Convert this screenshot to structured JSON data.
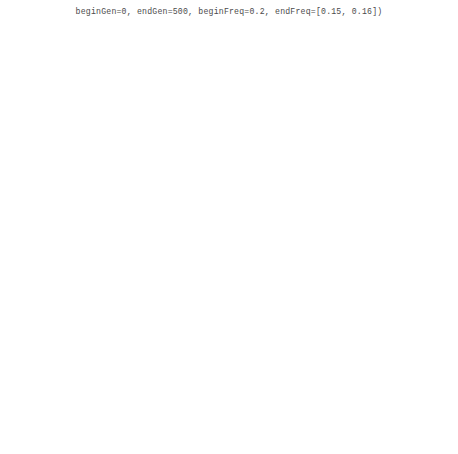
{
  "header": {
    "code_line": "beginGen=0, endGen=500, beginFreq=0.2, endFreq=[0.15, 0.16])"
  },
  "figure": {
    "xlabel": "Generation",
    "ylabel": "Allele frequency",
    "xticks": [
      0,
      100,
      200,
      300,
      400,
      500
    ],
    "panel_labels": [
      "(a)",
      "(b)",
      "(c)",
      "(d)"
    ]
  },
  "chart_data": [
    {
      "type": "line",
      "panel": "(a)",
      "title": "Constant population size",
      "xlabel": "Generation",
      "ylabel": "Allele frequency",
      "xlim": [
        0,
        500
      ],
      "ylim": [
        0.0,
        0.62
      ],
      "yticks": [
        0.0,
        0.1,
        0.2,
        0.3,
        0.4,
        0.5,
        0.6
      ],
      "ytick_labels": [
        "0.0",
        "0.1",
        "0.2",
        "0.3",
        "0.4",
        "0.5",
        "0.6"
      ],
      "grid": false,
      "legend": "none",
      "x": [
        0,
        10,
        20,
        30,
        40,
        50,
        60,
        70,
        80,
        90,
        100,
        110,
        120,
        130,
        140,
        150,
        160,
        170,
        180,
        190,
        200,
        210,
        220,
        230,
        240,
        250,
        260,
        270,
        280,
        290,
        300,
        310,
        320,
        330,
        340,
        350,
        360,
        370,
        380,
        390,
        400,
        410,
        420,
        430,
        440,
        450,
        460,
        470,
        480,
        490,
        500
      ],
      "series": [
        {
          "name": "upper bound",
          "style": "dashed",
          "values": [
            0.2,
            0.225,
            0.243,
            0.252,
            0.258,
            0.266,
            0.272,
            0.28,
            0.286,
            0.281,
            0.276,
            0.272,
            0.27,
            0.268,
            0.266,
            0.264,
            0.262,
            0.266,
            0.272,
            0.276,
            0.281,
            0.286,
            0.29,
            0.294,
            0.296,
            0.293,
            0.29,
            0.288,
            0.292,
            0.296,
            0.293,
            0.288,
            0.284,
            0.281,
            0.278,
            0.276,
            0.273,
            0.27,
            0.268,
            0.266,
            0.264,
            0.261,
            0.258,
            0.254,
            0.25,
            0.243,
            0.232,
            0.218,
            0.2,
            0.18,
            0.158
          ]
        },
        {
          "name": "median",
          "style": "solid",
          "values": [
            0.2,
            0.203,
            0.196,
            0.192,
            0.188,
            0.186,
            0.19,
            0.193,
            0.19,
            0.187,
            0.19,
            0.194,
            0.191,
            0.186,
            0.18,
            0.172,
            0.167,
            0.163,
            0.158,
            0.143,
            0.136,
            0.133,
            0.136,
            0.139,
            0.141,
            0.144,
            0.15,
            0.16,
            0.169,
            0.16,
            0.151,
            0.146,
            0.143,
            0.14,
            0.138,
            0.136,
            0.133,
            0.13,
            0.128,
            0.125,
            0.122,
            0.12,
            0.118,
            0.116,
            0.115,
            0.113,
            0.112,
            0.11,
            0.109,
            0.11,
            0.118
          ]
        },
        {
          "name": "lower bound",
          "style": "dashed",
          "values": [
            0.2,
            0.178,
            0.163,
            0.152,
            0.145,
            0.14,
            0.136,
            0.132,
            0.128,
            0.124,
            0.12,
            0.115,
            0.11,
            0.104,
            0.098,
            0.092,
            0.088,
            0.084,
            0.08,
            0.076,
            0.072,
            0.07,
            0.068,
            0.068,
            0.069,
            0.07,
            0.068,
            0.066,
            0.066,
            0.067,
            0.068,
            0.067,
            0.066,
            0.065,
            0.064,
            0.063,
            0.064,
            0.065,
            0.066,
            0.065,
            0.064,
            0.063,
            0.062,
            0.062,
            0.063,
            0.066,
            0.07,
            0.074,
            0.078,
            0.082,
            0.088
          ]
        }
      ]
    },
    {
      "type": "line",
      "panel": "(b)",
      "title": "Exponential population expansion",
      "xlabel": "Generation",
      "ylabel": "Allele frequency",
      "xlim": [
        0,
        500
      ],
      "ylim": [
        0.0,
        0.62
      ],
      "yticks": [
        0.0,
        0.1,
        0.2,
        0.3,
        0.4,
        0.5,
        0.6
      ],
      "ytick_labels": [
        "0.0",
        "0.1",
        "0.2",
        "0.3",
        "0.4",
        "0.5",
        "0.6"
      ],
      "grid": false,
      "legend": "none",
      "x": [
        0,
        10,
        20,
        30,
        40,
        50,
        60,
        70,
        80,
        90,
        100,
        110,
        120,
        130,
        140,
        150,
        160,
        170,
        180,
        190,
        200,
        210,
        220,
        230,
        240,
        250,
        260,
        270,
        280,
        290,
        300,
        310,
        320,
        330,
        340,
        350,
        360,
        370,
        380,
        390,
        400,
        410,
        420,
        430,
        440,
        450,
        460,
        470,
        480,
        490,
        500
      ],
      "series": [
        {
          "name": "upper bound",
          "style": "dashed",
          "values": [
            0.205,
            0.215,
            0.222,
            0.219,
            0.216,
            0.214,
            0.216,
            0.219,
            0.223,
            0.229,
            0.234,
            0.228,
            0.222,
            0.219,
            0.216,
            0.214,
            0.212,
            0.21,
            0.207,
            0.2,
            0.194,
            0.189,
            0.184,
            0.18,
            0.176,
            0.172,
            0.169,
            0.166,
            0.163,
            0.16,
            0.157,
            0.155,
            0.153,
            0.151,
            0.149,
            0.147,
            0.145,
            0.143,
            0.141,
            0.139,
            0.137,
            0.134,
            0.131,
            0.128,
            0.125,
            0.122,
            0.119,
            0.117,
            0.114,
            0.112,
            0.11
          ]
        },
        {
          "name": "median",
          "style": "solid",
          "values": [
            0.2,
            0.21,
            0.216,
            0.214,
            0.212,
            0.21,
            0.212,
            0.215,
            0.219,
            0.224,
            0.228,
            0.223,
            0.218,
            0.215,
            0.212,
            0.21,
            0.208,
            0.206,
            0.203,
            0.196,
            0.19,
            0.186,
            0.181,
            0.177,
            0.173,
            0.17,
            0.167,
            0.164,
            0.161,
            0.158,
            0.155,
            0.153,
            0.151,
            0.149,
            0.147,
            0.145,
            0.143,
            0.141,
            0.139,
            0.137,
            0.135,
            0.132,
            0.129,
            0.126,
            0.124,
            0.121,
            0.118,
            0.116,
            0.113,
            0.111,
            0.109
          ]
        },
        {
          "name": "lower bound",
          "style": "dashed",
          "values": [
            0.2,
            0.186,
            0.176,
            0.17,
            0.166,
            0.162,
            0.158,
            0.154,
            0.15,
            0.147,
            0.144,
            0.141,
            0.138,
            0.136,
            0.134,
            0.131,
            0.128,
            0.127,
            0.126,
            0.125,
            0.124,
            0.122,
            0.121,
            0.12,
            0.119,
            0.118,
            0.117,
            0.116,
            0.116,
            0.115,
            0.114,
            0.114,
            0.113,
            0.113,
            0.112,
            0.112,
            0.111,
            0.111,
            0.11,
            0.11,
            0.109,
            0.109,
            0.108,
            0.107,
            0.106,
            0.105,
            0.104,
            0.103,
            0.102,
            0.1,
            0.098
          ]
        }
      ]
    },
    {
      "type": "line",
      "panel": "(c)",
      "title": "Balancing selection",
      "xlabel": "Generation",
      "ylabel": "Allele frequency",
      "xlim": [
        0,
        500
      ],
      "ylim": [
        0.0,
        0.52
      ],
      "yticks": [
        0.0,
        0.1,
        0.2,
        0.3,
        0.4,
        0.5
      ],
      "ytick_labels": [
        "0.0",
        "0.1",
        "0.2",
        "0.3",
        "0.4",
        "0.5"
      ],
      "grid": false,
      "legend": "none",
      "x": [
        0,
        10,
        20,
        30,
        40,
        50,
        60,
        70,
        80,
        90,
        100,
        110,
        120,
        130,
        140,
        150,
        160,
        170,
        180,
        190,
        200,
        210,
        220,
        230,
        240,
        250,
        260,
        270,
        280,
        290,
        300,
        310,
        320,
        330,
        340,
        350,
        360,
        370,
        380,
        390,
        400,
        410,
        420,
        430,
        440,
        450,
        460,
        470,
        480,
        490,
        500
      ],
      "series": [
        {
          "name": "upper bound",
          "style": "dashed",
          "values": [
            0.2,
            0.232,
            0.252,
            0.265,
            0.274,
            0.281,
            0.288,
            0.293,
            0.298,
            0.302,
            0.303,
            0.305,
            0.306,
            0.308,
            0.31,
            0.312,
            0.314,
            0.313,
            0.315,
            0.318,
            0.322,
            0.326,
            0.33,
            0.334,
            0.33,
            0.334,
            0.331,
            0.335,
            0.338,
            0.335,
            0.331,
            0.328,
            0.325,
            0.322,
            0.32,
            0.318,
            0.316,
            0.318,
            0.32,
            0.322,
            0.325,
            0.322,
            0.32,
            0.317,
            0.313,
            0.305,
            0.292,
            0.272,
            0.248,
            0.225,
            0.205
          ]
        },
        {
          "name": "median",
          "style": "solid",
          "values": [
            0.2,
            0.215,
            0.223,
            0.228,
            0.232,
            0.228,
            0.224,
            0.228,
            0.232,
            0.227,
            0.223,
            0.215,
            0.196,
            0.204,
            0.212,
            0.22,
            0.226,
            0.23,
            0.226,
            0.22,
            0.214,
            0.21,
            0.206,
            0.203,
            0.2,
            0.197,
            0.194,
            0.19,
            0.186,
            0.182,
            0.178,
            0.176,
            0.156,
            0.148,
            0.13,
            0.11,
            0.096,
            0.098,
            0.105,
            0.115,
            0.128,
            0.142,
            0.156,
            0.168,
            0.18,
            0.196,
            0.212,
            0.205,
            0.208,
            0.212,
            0.208
          ]
        },
        {
          "name": "lower bound",
          "style": "dashed",
          "values": [
            0.2,
            0.178,
            0.166,
            0.16,
            0.156,
            0.152,
            0.148,
            0.145,
            0.142,
            0.139,
            0.136,
            0.13,
            0.124,
            0.118,
            0.113,
            0.11,
            0.106,
            0.103,
            0.1,
            0.098,
            0.097,
            0.096,
            0.095,
            0.094,
            0.093,
            0.092,
            0.091,
            0.09,
            0.089,
            0.088,
            0.086,
            0.084,
            0.082,
            0.08,
            0.078,
            0.08,
            0.085,
            0.092,
            0.1,
            0.108,
            0.118,
            0.128,
            0.138,
            0.146,
            0.152,
            0.158,
            0.163,
            0.166,
            0.17,
            0.175,
            0.183
          ]
        }
      ]
    },
    {
      "type": "line",
      "panel": "(d)",
      "title": "Varying selection pressure",
      "xlabel": "Generation",
      "ylabel": "Allele frequency",
      "xlim": [
        0,
        500
      ],
      "ylim": [
        0.0,
        0.62
      ],
      "yticks": [
        0.0,
        0.1,
        0.2,
        0.3,
        0.4,
        0.5,
        0.6
      ],
      "ytick_labels": [
        "0.0",
        "0.1",
        "0.2",
        "0.3",
        "0.4",
        "0.5",
        "0.6"
      ],
      "grid": false,
      "legend": "none",
      "x": [
        0,
        10,
        20,
        30,
        40,
        50,
        60,
        70,
        80,
        90,
        100,
        110,
        120,
        130,
        140,
        150,
        160,
        170,
        180,
        190,
        200,
        210,
        220,
        230,
        240,
        250,
        260,
        270,
        280,
        290,
        300,
        310,
        320,
        330,
        340,
        350,
        360,
        370,
        380,
        390,
        400,
        410,
        420,
        430,
        440,
        450,
        460,
        470,
        480,
        490,
        500
      ],
      "series": [
        {
          "name": "upper bound",
          "style": "dashed",
          "values": [
            0.205,
            0.222,
            0.232,
            0.24,
            0.248,
            0.256,
            0.264,
            0.272,
            0.283,
            0.296,
            0.31,
            0.322,
            0.336,
            0.352,
            0.366,
            0.381,
            0.396,
            0.412,
            0.428,
            0.448,
            0.47,
            0.5,
            0.53,
            0.556,
            0.568,
            0.545,
            0.52,
            0.5,
            0.488,
            0.47,
            0.455,
            0.448,
            0.44,
            0.432,
            0.425,
            0.418,
            0.412,
            0.404,
            0.396,
            0.39,
            0.382,
            0.356,
            0.348,
            0.34,
            0.332,
            0.318,
            0.3,
            0.272,
            0.24,
            0.2,
            0.16
          ]
        },
        {
          "name": "median",
          "style": "solid",
          "values": [
            0.2,
            0.206,
            0.21,
            0.213,
            0.216,
            0.22,
            0.224,
            0.228,
            0.234,
            0.242,
            0.252,
            0.266,
            0.282,
            0.3,
            0.318,
            0.33,
            0.34,
            0.352,
            0.368,
            0.39,
            0.412,
            0.438,
            0.458,
            0.472,
            0.478,
            0.47,
            0.456,
            0.44,
            0.42,
            0.396,
            0.37,
            0.34,
            0.31,
            0.288,
            0.268,
            0.252,
            0.24,
            0.232,
            0.224,
            0.216,
            0.21,
            0.204,
            0.2,
            0.204,
            0.2,
            0.196,
            0.192,
            0.196,
            0.2,
            0.188,
            0.165
          ]
        },
        {
          "name": "lower bound",
          "style": "dashed",
          "values": [
            0.198,
            0.192,
            0.188,
            0.186,
            0.184,
            0.186,
            0.19,
            0.194,
            0.198,
            0.203,
            0.21,
            0.218,
            0.226,
            0.232,
            0.226,
            0.22,
            0.225,
            0.232,
            0.24,
            0.248,
            0.252,
            0.258,
            0.262,
            0.266,
            0.27,
            0.276,
            0.282,
            0.29,
            0.286,
            0.278,
            0.272,
            0.28,
            0.288,
            0.296,
            0.3,
            0.306,
            0.312,
            0.32,
            0.318,
            0.31,
            0.302,
            0.3,
            0.304,
            0.296,
            0.284,
            0.268,
            0.248,
            0.222,
            0.196,
            0.172,
            0.15
          ]
        }
      ]
    }
  ]
}
